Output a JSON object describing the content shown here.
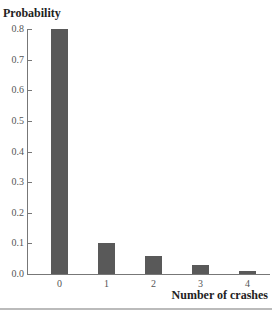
{
  "chart_data": {
    "type": "bar",
    "title": "",
    "ylabel": "Probability",
    "xlabel": "Number of crashes",
    "categories": [
      "0",
      "1",
      "2",
      "3",
      "4"
    ],
    "values": [
      0.8,
      0.1,
      0.06,
      0.03,
      0.01
    ],
    "ylim": [
      0.0,
      0.8
    ],
    "yticks": [
      "0.0",
      "0.1",
      "0.2",
      "0.3",
      "0.4",
      "0.5",
      "0.6",
      "0.7",
      "0.8"
    ],
    "grid": false,
    "bar_color": "#595959"
  }
}
